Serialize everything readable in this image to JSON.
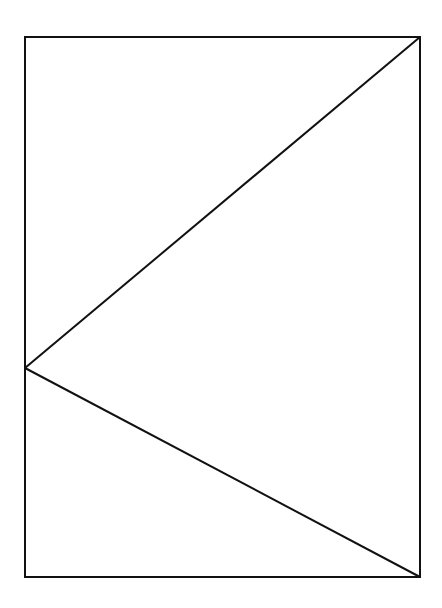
{
  "diagram": {
    "canvas": {
      "width": 442,
      "height": 608,
      "background": "#ffffff"
    },
    "stroke": {
      "color": "#111111",
      "width": 2
    },
    "rectangle": {
      "x": 25,
      "y": 37,
      "width": 395,
      "height": 540
    },
    "points": {
      "top_left": {
        "x": 25,
        "y": 37
      },
      "top_right": {
        "x": 420,
        "y": 37
      },
      "bottom_right": {
        "x": 420,
        "y": 577
      },
      "bottom_left": {
        "x": 25,
        "y": 577
      },
      "left_apex": {
        "x": 25,
        "y": 368
      }
    },
    "segments": [
      {
        "name": "diagonal-upper",
        "from": "top_right",
        "to": "left_apex"
      },
      {
        "name": "diagonal-lower",
        "from": "left_apex",
        "to": "bottom_right"
      }
    ]
  }
}
